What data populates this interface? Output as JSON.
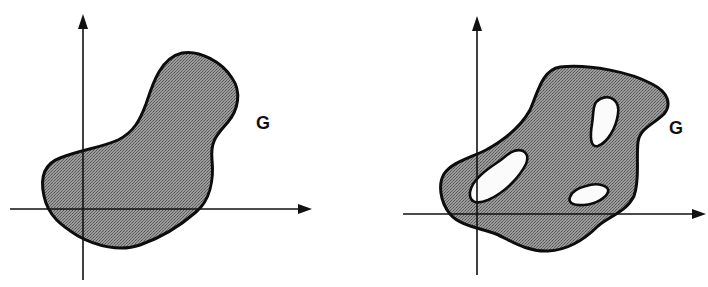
{
  "figure": {
    "fill_color": "#8a8a8a",
    "stroke_color": "#0d0d0d",
    "hole_color": "#fbfbfb",
    "panels": [
      {
        "id": "simply-connected",
        "region_label": "G",
        "hole_count": 0
      },
      {
        "id": "multiply-connected",
        "region_label": "G",
        "hole_count": 3
      }
    ]
  }
}
